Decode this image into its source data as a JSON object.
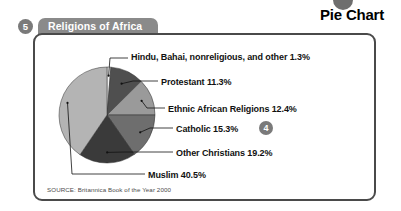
{
  "section": {
    "title": "Pie Chart",
    "bullet_icon": "filled-circle-icon"
  },
  "panel": {
    "number_badge": "5",
    "title": "Religions of Africa",
    "source": "SOURCE: Britannica Book of the Year 2000",
    "inline_badge": "4"
  },
  "colors": {
    "badge_gray": "#7a7a7a",
    "tab_gray": "#8a8a8a",
    "panel_border": "#4a4a4a",
    "slice_dark": "#3a3a3a",
    "slice_mid_dark": "#4f4f4f",
    "slice_mid": "#6e6e6e",
    "slice_light": "#9a9a9a",
    "slice_lighter": "#b4b4b4",
    "slice_white": "#f2f2f2",
    "text": "#111111"
  },
  "chart_data": {
    "type": "pie",
    "title": "Religions of Africa",
    "source": "SOURCE: Britannica Book of the Year 2000",
    "unit": "percent",
    "legend": "callout-labels",
    "total": 100.0,
    "categories": [
      "Hindu, Bahai, nonreligious, and other",
      "Protestant",
      "Ethnic African Religions",
      "Catholic",
      "Other Christians",
      "Muslim"
    ],
    "values": [
      1.3,
      11.3,
      12.4,
      15.3,
      19.2,
      40.5
    ],
    "labels": [
      "Hindu, Bahai, nonreligious, and other 1.3%",
      "Protestant 11.3%",
      "Ethnic African Religions 12.4%",
      "Catholic 15.3%",
      "Other Christians 19.2%",
      "Muslim 40.5%"
    ],
    "slice_colors": [
      "#f2f2f2",
      "#4f4f4f",
      "#9a9a9a",
      "#6e6e6e",
      "#3a3a3a",
      "#b4b4b4"
    ],
    "start_angle_deg": 0,
    "direction": "clockwise",
    "center": {
      "x": 107,
      "y": 115
    },
    "radius": 48
  }
}
